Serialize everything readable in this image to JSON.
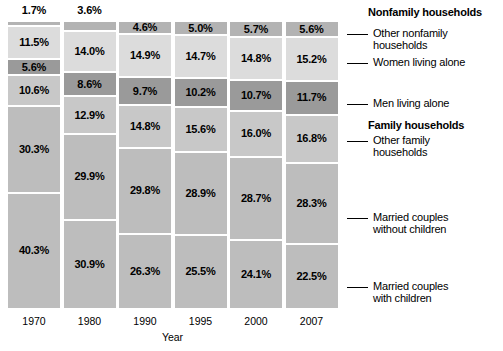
{
  "chart_data": {
    "type": "bar",
    "title": "",
    "xlabel": "Year",
    "ylabel": "",
    "stacked": true,
    "percent_stacked": true,
    "ylim": [
      0,
      100
    ],
    "grid": false,
    "legend_position": "right",
    "categories": [
      "1970",
      "1980",
      "1990",
      "1995",
      "2000",
      "2007"
    ],
    "series": [
      {
        "name": "Other nonfamily households",
        "group": "Nonfamily households",
        "color": "#b3b3b3",
        "values": [
          1.7,
          3.6,
          4.6,
          5.0,
          5.7,
          5.6
        ],
        "labels": [
          "1.7%",
          "3.6%",
          "4.6%",
          "5.0%",
          "5.7%",
          "5.6%"
        ]
      },
      {
        "name": "Women living alone",
        "group": "Nonfamily households",
        "color": "#dcdcdc",
        "values": [
          11.5,
          14.0,
          14.9,
          14.7,
          14.8,
          15.2
        ],
        "labels": [
          "11.5%",
          "14.0%",
          "14.9%",
          "14.7%",
          "14.8%",
          "15.2%"
        ]
      },
      {
        "name": "Men living alone",
        "group": "Nonfamily households",
        "color": "#9a9a9a",
        "values": [
          5.6,
          8.6,
          9.7,
          10.2,
          10.7,
          11.7
        ],
        "labels": [
          "5.6%",
          "8.6%",
          "9.7%",
          "10.2%",
          "10.7%",
          "11.7%"
        ]
      },
      {
        "name": "Other family households",
        "group": "Family households",
        "color": "#c8c8c8",
        "values": [
          10.6,
          12.9,
          14.8,
          15.6,
          16.0,
          16.8
        ],
        "labels": [
          "10.6%",
          "12.9%",
          "14.8%",
          "15.6%",
          "16.0%",
          "16.8%"
        ]
      },
      {
        "name": "Married couples without children",
        "group": "Family households",
        "color": "#bdbdbd",
        "values": [
          30.3,
          29.9,
          29.8,
          28.9,
          28.7,
          28.3
        ],
        "labels": [
          "30.3%",
          "29.9%",
          "29.8%",
          "28.9%",
          "28.7%",
          "28.3%"
        ]
      },
      {
        "name": "Married couples with children",
        "group": "Family households",
        "color": "#bdbdbd",
        "values": [
          40.3,
          30.9,
          26.3,
          25.5,
          24.1,
          22.5
        ],
        "labels": [
          "40.3%",
          "30.9%",
          "26.3%",
          "25.5%",
          "24.1%",
          "22.5%"
        ]
      }
    ]
  },
  "axis": {
    "x_title": "Year",
    "year_labels": [
      "1970",
      "1980",
      "1990",
      "1995",
      "2000",
      "2007"
    ]
  },
  "legend": {
    "headings": [
      {
        "label": "Nonfamily households"
      },
      {
        "label": "Family households"
      }
    ],
    "items": [
      {
        "label": "Other nonfamily\nhouseholds"
      },
      {
        "label": "Women living alone"
      },
      {
        "label": "Men living alone"
      },
      {
        "label": "Other family\nhouseholds"
      },
      {
        "label": "Married couples\nwithout children"
      },
      {
        "label": "Married couples\nwith children"
      }
    ]
  },
  "columns": [
    {
      "year": "1970",
      "top_label_outside": "1.7%",
      "segments": [
        {
          "label": "1.7%",
          "value": 1.7,
          "inside": false
        },
        {
          "label": "11.5%",
          "value": 11.5,
          "inside": true
        },
        {
          "label": "5.6%",
          "value": 5.6,
          "inside": true
        },
        {
          "label": "10.6%",
          "value": 10.6,
          "inside": true
        },
        {
          "label": "30.3%",
          "value": 30.3,
          "inside": true
        },
        {
          "label": "40.3%",
          "value": 40.3,
          "inside": true
        }
      ]
    },
    {
      "year": "1980",
      "top_label_outside": "3.6%",
      "segments": [
        {
          "label": "3.6%",
          "value": 3.6,
          "inside": false
        },
        {
          "label": "14.0%",
          "value": 14.0,
          "inside": true
        },
        {
          "label": "8.6%",
          "value": 8.6,
          "inside": true
        },
        {
          "label": "12.9%",
          "value": 12.9,
          "inside": true
        },
        {
          "label": "29.9%",
          "value": 29.9,
          "inside": true
        },
        {
          "label": "30.9%",
          "value": 30.9,
          "inside": true
        }
      ]
    },
    {
      "year": "1990",
      "top_label_outside": "",
      "segments": [
        {
          "label": "4.6%",
          "value": 4.6,
          "inside": true
        },
        {
          "label": "14.9%",
          "value": 14.9,
          "inside": true
        },
        {
          "label": "9.7%",
          "value": 9.7,
          "inside": true
        },
        {
          "label": "14.8%",
          "value": 14.8,
          "inside": true
        },
        {
          "label": "29.8%",
          "value": 29.8,
          "inside": true
        },
        {
          "label": "26.3%",
          "value": 26.3,
          "inside": true
        }
      ]
    },
    {
      "year": "1995",
      "top_label_outside": "",
      "segments": [
        {
          "label": "5.0%",
          "value": 5.0,
          "inside": true
        },
        {
          "label": "14.7%",
          "value": 14.7,
          "inside": true
        },
        {
          "label": "10.2%",
          "value": 10.2,
          "inside": true
        },
        {
          "label": "15.6%",
          "value": 15.6,
          "inside": true
        },
        {
          "label": "28.9%",
          "value": 28.9,
          "inside": true
        },
        {
          "label": "25.5%",
          "value": 25.5,
          "inside": true
        }
      ]
    },
    {
      "year": "2000",
      "top_label_outside": "",
      "segments": [
        {
          "label": "5.7%",
          "value": 5.7,
          "inside": true
        },
        {
          "label": "14.8%",
          "value": 14.8,
          "inside": true
        },
        {
          "label": "10.7%",
          "value": 10.7,
          "inside": true
        },
        {
          "label": "16.0%",
          "value": 16.0,
          "inside": true
        },
        {
          "label": "28.7%",
          "value": 28.7,
          "inside": true
        },
        {
          "label": "24.1%",
          "value": 24.1,
          "inside": true
        }
      ]
    },
    {
      "year": "2007",
      "top_label_outside": "",
      "segments": [
        {
          "label": "5.6%",
          "value": 5.6,
          "inside": true
        },
        {
          "label": "15.2%",
          "value": 15.2,
          "inside": true
        },
        {
          "label": "11.7%",
          "value": 11.7,
          "inside": true
        },
        {
          "label": "16.8%",
          "value": 16.8,
          "inside": true
        },
        {
          "label": "28.3%",
          "value": 28.3,
          "inside": true
        },
        {
          "label": "22.5%",
          "value": 22.5,
          "inside": true
        }
      ]
    }
  ]
}
